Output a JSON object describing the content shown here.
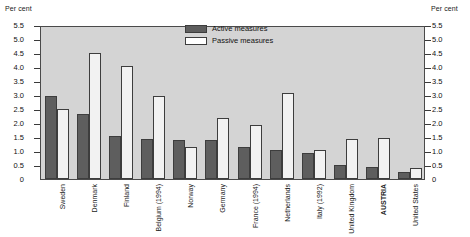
{
  "axis_titles": {
    "left": "Per cent",
    "right": "Per cent"
  },
  "legend": {
    "items": [
      {
        "label": "Active measures",
        "color": "#5e5e5e"
      },
      {
        "label": "Passive measures",
        "color": "#ffffff"
      }
    ]
  },
  "chart_data": {
    "type": "bar",
    "title": "",
    "xlabel": "",
    "ylabel": "Per cent",
    "ylim": [
      0,
      5.5
    ],
    "yticks": [
      "0",
      "0.5",
      "1.0",
      "1.5",
      "2.0",
      "2.5",
      "3.0",
      "3.5",
      "4.0",
      "4.5",
      "5.0",
      "5.5"
    ],
    "ytick_values": [
      0,
      0.5,
      1.0,
      1.5,
      2.0,
      2.5,
      3.0,
      3.5,
      4.0,
      4.5,
      5.0,
      5.5
    ],
    "grid": false,
    "legend_position": "top-center",
    "categories": [
      "Sweden",
      "Denmark",
      "Finland",
      "Belgium (1994)",
      "Norway",
      "Germany",
      "France (1994)",
      "Netherlands",
      "Italy (1992)",
      "United Kingdom",
      "AUSTRIA",
      "United States"
    ],
    "highlighted_category": "AUSTRIA",
    "series": [
      {
        "name": "Active measures",
        "color": "#5e5e5e",
        "values": [
          3.0,
          2.35,
          1.55,
          1.45,
          1.4,
          1.4,
          1.15,
          1.05,
          0.95,
          0.5,
          0.45,
          0.25
        ]
      },
      {
        "name": "Passive measures",
        "color": "#ffffff",
        "values": [
          2.55,
          4.55,
          4.1,
          3.0,
          1.15,
          2.2,
          1.95,
          3.1,
          1.05,
          1.45,
          1.5,
          0.4
        ]
      }
    ]
  }
}
